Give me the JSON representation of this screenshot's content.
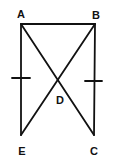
{
  "diagram": {
    "type": "geometry",
    "colors": {
      "line": "#111111",
      "background": "#ffffff"
    },
    "points": {
      "A": {
        "label": "A",
        "x": 21,
        "y": 24
      },
      "B": {
        "label": "B",
        "x": 95,
        "y": 24
      },
      "C": {
        "label": "C",
        "x": 94,
        "y": 135
      },
      "D": {
        "label": "D",
        "x": 58,
        "y": 79
      },
      "E": {
        "label": "E",
        "x": 21,
        "y": 135
      }
    },
    "segments": [
      {
        "from": "A",
        "to": "B"
      },
      {
        "from": "A",
        "to": "E"
      },
      {
        "from": "B",
        "to": "C"
      },
      {
        "from": "A",
        "to": "C"
      },
      {
        "from": "B",
        "to": "E"
      }
    ],
    "tick_marks": [
      {
        "segment": "AE",
        "count": 1
      },
      {
        "segment": "BC",
        "count": 1
      }
    ]
  }
}
